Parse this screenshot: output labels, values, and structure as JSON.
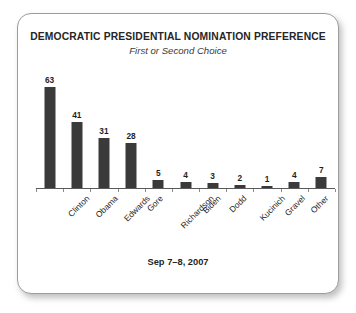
{
  "card": {
    "accent_color": "#3a3a3a",
    "border_color": "#9c9c9c",
    "background": "#ffffff"
  },
  "chart_data": {
    "type": "bar",
    "title": "DEMOCRATIC PRESIDENTIAL NOMINATION PREFERENCE",
    "subtitle": "First or Second Choice",
    "footnote": "Sep 7–8, 2007",
    "categories": [
      "Clinton",
      "Obama",
      "Edwards",
      "Gore",
      "Richardson",
      "Biden",
      "Dodd",
      "Kucinich",
      "Gravel",
      "Other",
      "None/\nNo opinion"
    ],
    "values": [
      63,
      41,
      31,
      28,
      5,
      4,
      3,
      2,
      1,
      4,
      7
    ],
    "xlabel": "",
    "ylabel": "",
    "ylim": [
      0,
      70
    ],
    "grid": false,
    "legend": false,
    "bar_color": "#3a3a3a",
    "value_labels": [
      "63",
      "41",
      "31",
      "28",
      "5",
      "4",
      "3",
      "2",
      "1",
      "4",
      "7"
    ]
  }
}
